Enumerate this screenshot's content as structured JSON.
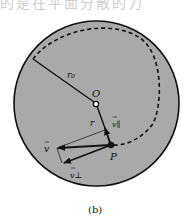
{
  "header_fragment": "的是在平面分散的力",
  "figure": {
    "caption": "(b)",
    "labels": {
      "r0": "r₀",
      "origin": "O",
      "r": "r",
      "point": "P",
      "v": "v",
      "v_parallel": "v∥",
      "v_perp": "v⊥"
    },
    "colors": {
      "disk_fill": "#a9a9a9",
      "stroke": "#111111",
      "background": "#ffffff"
    }
  }
}
